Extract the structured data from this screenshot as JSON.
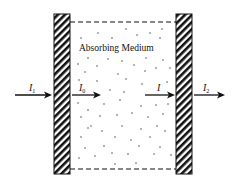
{
  "diagram": {
    "medium_label": "Absorbing Medium",
    "labels": {
      "incident": "I",
      "incident_sub": "1",
      "entering": "I",
      "entering_sub": "0",
      "exiting": "I",
      "transmitted": "I",
      "transmitted_sub": "2"
    },
    "colors": {
      "ink": "#111111",
      "background": "#ffffff"
    }
  }
}
